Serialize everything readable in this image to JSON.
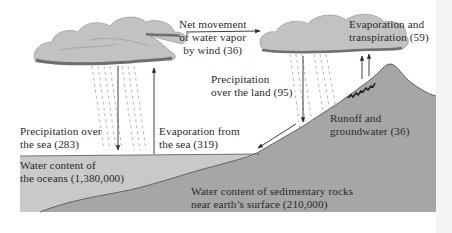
{
  "diagram": {
    "type": "water-cycle",
    "colors": {
      "ocean": "#c9c9c9",
      "land": "#a6a6a6",
      "cloud": "#c2c2c2",
      "cloud_shadow": "#6e6e6e",
      "arrow": "#2a2a2a",
      "text": "#2a2a2a"
    },
    "labels": {
      "net_movement": "Net movement\nof water vapor\nby wind (36)",
      "evap_transpiration": "Evaporation and\ntranspiration (59)",
      "precip_land": "Precipitation\nover the land (95)",
      "precip_sea": "Precipitation over\nthe sea (283)",
      "evap_sea": "Evaporation from\nthe sea (319)",
      "runoff": "Runoff and\ngroundwater (36)",
      "oceans": "Water content of\nthe oceans (1,380,000)",
      "rocks": "Water content of sedimentary rocks\nnear earth’s surface (210,000)"
    },
    "flows": [
      {
        "name": "Net movement of water vapor by wind",
        "value": 36
      },
      {
        "name": "Evaporation and transpiration",
        "value": 59
      },
      {
        "name": "Precipitation over the land",
        "value": 95
      },
      {
        "name": "Precipitation over the sea",
        "value": 283
      },
      {
        "name": "Evaporation from the sea",
        "value": 319
      },
      {
        "name": "Runoff and groundwater",
        "value": 36
      }
    ],
    "reservoirs": [
      {
        "name": "Water content of the oceans",
        "value": 1380000
      },
      {
        "name": "Water content of sedimentary rocks near earth's surface",
        "value": 210000
      }
    ]
  }
}
